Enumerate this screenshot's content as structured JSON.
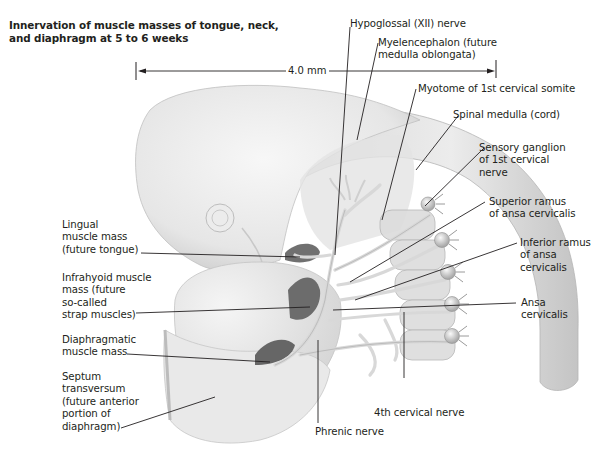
{
  "figure": {
    "title_line1": "Innervation of muscle masses of tongue, neck,",
    "title_line2": "and diaphragm at 5 to 6 weeks",
    "scale_bar": {
      "label": "4.0 mm"
    },
    "colors": {
      "tissue_light": "#eeeeee",
      "tissue_mid": "#cfcfcf",
      "muscle_dark": "#6d6d6d",
      "nerve": "#e2e2e2",
      "line": "#231f20"
    },
    "labels_right": [
      {
        "lines": [
          "Hypoglossal (XII) nerve"
        ]
      },
      {
        "lines": [
          "Myelencephalon (future",
          "medulla oblongata)"
        ]
      },
      {
        "lines": [
          "Myotome of 1st cervical somite"
        ]
      },
      {
        "lines": [
          "Spinal medulla (cord)"
        ]
      },
      {
        "lines": [
          "Sensory ganglion",
          "of 1st cervical",
          "nerve"
        ]
      },
      {
        "lines": [
          "Superior ramus",
          "of ansa cervicalis"
        ]
      },
      {
        "lines": [
          "Inferior ramus",
          "of ansa",
          "cervicalis"
        ]
      },
      {
        "lines": [
          "Ansa",
          "cervicalis"
        ]
      }
    ],
    "labels_left": [
      {
        "lines": [
          "Lingual",
          "muscle mass",
          "(future tongue)"
        ]
      },
      {
        "lines": [
          "Infrahyoid muscle",
          "mass (future",
          "so-called",
          "strap muscles)"
        ]
      },
      {
        "lines": [
          "Diaphragmatic",
          "muscle mass"
        ]
      },
      {
        "lines": [
          "Septum",
          "transversum",
          "(future anterior",
          "portion of",
          "diaphragm)"
        ]
      }
    ],
    "labels_bottom": [
      {
        "lines": [
          "4th cervical nerve"
        ]
      },
      {
        "lines": [
          "Phrenic nerve"
        ]
      }
    ]
  }
}
